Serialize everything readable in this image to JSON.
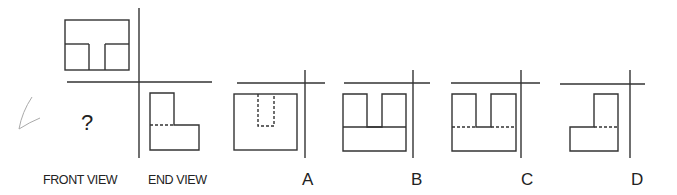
{
  "labels": {
    "front_view": "FRONT VIEW",
    "end_view": "END VIEW",
    "unknown": "?"
  },
  "options": [
    {
      "id": "A",
      "label": "A"
    },
    {
      "id": "B",
      "label": "B"
    },
    {
      "id": "C",
      "label": "C"
    },
    {
      "id": "D",
      "label": "D"
    }
  ],
  "colors": {
    "line": "#333333",
    "pencil_mark": "#aaaaaa"
  }
}
